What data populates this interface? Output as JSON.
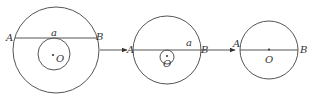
{
  "diagram": {
    "colors": {
      "stroke": "#555555",
      "text": "#333333",
      "background": "#ffffff"
    },
    "panels": [
      {
        "outer_circle": {
          "cx": 56,
          "cy": 50,
          "r": 43
        },
        "inner_circle": {
          "cx": 54,
          "cy": 54,
          "r": 16
        },
        "chord_y": 38,
        "labels": {
          "A": "A",
          "B": "B",
          "a": "a",
          "O": "O"
        }
      },
      {
        "outer_circle": {
          "cx": 167,
          "cy": 50,
          "r": 34
        },
        "inner_circle": {
          "cx": 167,
          "cy": 57,
          "r": 7
        },
        "chord_y": 50,
        "labels": {
          "A": "A",
          "B": "B",
          "a": "a",
          "O": "O"
        }
      },
      {
        "outer_circle": {
          "cx": 269,
          "cy": 50,
          "r": 29
        },
        "chord_y": 50,
        "labels": {
          "A": "A",
          "B": "B",
          "O": "O"
        }
      }
    ],
    "arrows": [
      {
        "x1": 100,
        "x2": 128,
        "y": 50
      },
      {
        "x1": 203,
        "x2": 236,
        "y": 50
      }
    ]
  }
}
